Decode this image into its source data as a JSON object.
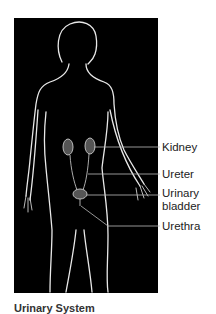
{
  "figure": {
    "background_color": "#000000",
    "outline_color": "#e8e8e8",
    "organ_color": "#bdbdbd"
  },
  "labels": [
    {
      "text": "Kidney",
      "line_y": 147
    },
    {
      "text": "Ureter",
      "line_y": 174
    },
    {
      "text": "Urinary",
      "line_y": 195
    },
    {
      "text": "bladder"
    },
    {
      "text": "Urethra",
      "line_y": 226
    }
  ],
  "caption": {
    "text": "Urinary System"
  }
}
